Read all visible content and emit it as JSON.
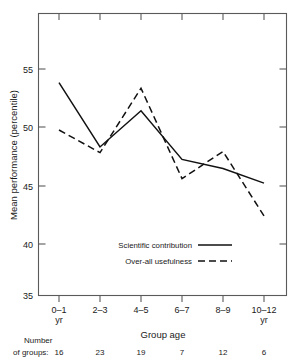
{
  "chart_data": {
    "type": "line",
    "title": "",
    "xlabel": "Group age",
    "ylabel": "Mean performance (percentile)",
    "categories": [
      "0-1\nyr",
      "2-3",
      "4-5",
      "6-7",
      "8-9",
      "10-12\nyr"
    ],
    "category_labels": [
      {
        "line1": "0–1",
        "line2": "yr"
      },
      {
        "line1": "2–3",
        "line2": ""
      },
      {
        "line1": "4–5",
        "line2": ""
      },
      {
        "line1": "6–7",
        "line2": ""
      },
      {
        "line1": "8–9",
        "line2": ""
      },
      {
        "line1": "10–12",
        "line2": "yr"
      }
    ],
    "ylim": [
      35,
      57
    ],
    "yticks": [
      35,
      40,
      45,
      50,
      55
    ],
    "ytick_labels": [
      "35",
      "40",
      "45",
      "50",
      "55"
    ],
    "grid": false,
    "legend_position": "inside-lower-center",
    "series": [
      {
        "name": "Scientific contribution",
        "style": "solid",
        "color": "#111111",
        "values": [
          53.8,
          48.1,
          51.3,
          47.0,
          46.2,
          44.9
        ]
      },
      {
        "name": "Over-all usefulness",
        "style": "dashed",
        "color": "#111111",
        "values": [
          49.6,
          47.6,
          53.3,
          45.3,
          47.7,
          42.0
        ]
      }
    ],
    "annotations": {
      "count_row_label_line1": "Number",
      "count_row_label_line2": "of groups:",
      "counts": [
        "16",
        "23",
        "19",
        "7",
        "12",
        "6"
      ]
    }
  },
  "figure": {
    "axis_y_title": "Mean performance (percentile)",
    "axis_x_title": "Group age"
  }
}
